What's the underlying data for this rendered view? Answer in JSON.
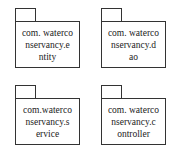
{
  "diagram": {
    "type": "uml-package-diagram",
    "packages": [
      {
        "name": "com.waterconservancy.entity",
        "label": "com. waterco\nnservancy.e\nntity"
      },
      {
        "name": "com.waterconservancy.dao",
        "label": "com. waterco\nnservancy.d\nao"
      },
      {
        "name": "com.waterconservancy.service",
        "label": "com.waterco\nnservancy.s\nervice"
      },
      {
        "name": "com.waterconservancy.controller",
        "label": "com. waterco\nnservancy.c\nontroller"
      }
    ]
  }
}
